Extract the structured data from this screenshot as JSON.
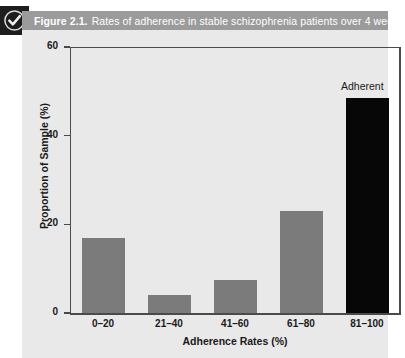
{
  "figure": {
    "icon_name": "check-circle-icon",
    "number_label": "Figure 2.1.",
    "caption": "Rates of adherence in stable schizophrenia patients over 4 weeks.",
    "banner_color": "#9b9b9b",
    "icon_background": "#1d1d1d"
  },
  "chart_data": {
    "type": "bar",
    "title": "Rates of adherence in stable schizophrenia patients over 4 weeks.",
    "xlabel": "Adherence Rates (%)",
    "ylabel": "Proportion of Sample (%)",
    "categories": [
      "0–20",
      "21–40",
      "41–60",
      "61–80",
      "81–100"
    ],
    "values": [
      17,
      4,
      7.5,
      23,
      48.5
    ],
    "bar_colors": [
      "#7b7b7b",
      "#7b7b7b",
      "#7b7b7b",
      "#7b7b7b",
      "#070707"
    ],
    "ylim": [
      0,
      60
    ],
    "yticks": [
      0,
      20,
      40,
      60
    ],
    "ytick_labels": [
      "0",
      "20",
      "40",
      "60"
    ],
    "grid": false,
    "legend": false,
    "annotations": [
      {
        "text": "Adherent",
        "category": "81–100",
        "position": "above-bar"
      }
    ],
    "plot_background": "#e9e9e9",
    "axis_color": "#4a4a4a"
  }
}
